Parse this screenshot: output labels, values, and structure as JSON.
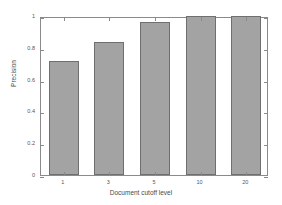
{
  "chart_data": {
    "type": "bar",
    "title": "",
    "xlabel": "Document cutoff level",
    "ylabel": "Precision",
    "categories": [
      "1",
      "3",
      "5",
      "10",
      "20"
    ],
    "values": [
      0.72,
      0.835,
      0.96,
      1.0,
      1.0
    ],
    "ylim": [
      0,
      1
    ],
    "yticks": [
      0,
      0.2,
      0.4,
      0.6,
      0.8,
      1
    ],
    "ytick_labels": [
      "0",
      "0.2",
      "0.4",
      "0.6",
      "0.8",
      "1"
    ],
    "xtick_labels": [
      "1",
      "3",
      "5",
      "10",
      "20"
    ],
    "grid": false,
    "legend": null,
    "bar_color": "#a3a3a3",
    "bar_edge_color": "#6f6f6f",
    "axis_color": "#8a8a8a",
    "background_color": "#ffffff"
  }
}
